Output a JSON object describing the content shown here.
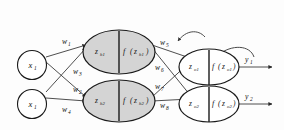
{
  "diagram": {
    "colors": {
      "background": "#fdfdfd",
      "node_fill_hidden": "#d4d4d4",
      "node_fill_output": "#ffffff",
      "node_stroke": "#1a1a1a",
      "edge": "#3a3a3a"
    },
    "input_layer": {
      "nodes": [
        {
          "id": "x1",
          "label": "x",
          "subscript": "1"
        },
        {
          "id": "x2",
          "label": "x",
          "subscript": "1"
        }
      ]
    },
    "hidden_layer": {
      "nodes": [
        {
          "id": "h1",
          "net_label": "z",
          "net_sub": "h1",
          "fn_label": "f",
          "fn_arg_open": "(",
          "fn_arg": "z",
          "fn_arg_sub": "h1",
          "fn_arg_close": ")"
        },
        {
          "id": "h2",
          "net_label": "z",
          "net_sub": "h2",
          "fn_label": "f",
          "fn_arg_open": "(",
          "fn_arg": "z",
          "fn_arg_sub": "h2",
          "fn_arg_close": ")"
        }
      ]
    },
    "output_layer": {
      "nodes": [
        {
          "id": "o1",
          "net_label": "z",
          "net_sub": "o1",
          "fn_label": "f",
          "fn_arg_open": "(",
          "fn_arg": "z",
          "fn_arg_sub": "o1",
          "fn_arg_close": ")"
        },
        {
          "id": "o2",
          "net_label": "z",
          "net_sub": "o2",
          "fn_label": "f",
          "fn_arg_open": "(",
          "fn_arg": "z",
          "fn_arg_sub": "o2",
          "fn_arg_close": ")"
        }
      ]
    },
    "outputs": [
      {
        "id": "y1",
        "label": "y",
        "subscript": "1"
      },
      {
        "id": "y2",
        "label": "y",
        "subscript": "2"
      }
    ],
    "weights_input_hidden": [
      {
        "id": "w1",
        "label": "w",
        "subscript": "1",
        "from": "x1",
        "to": "h1"
      },
      {
        "id": "w2",
        "label": "w",
        "subscript": "2",
        "from": "x1",
        "to": "h2"
      },
      {
        "id": "w3",
        "label": "w",
        "subscript": "3",
        "from": "x2",
        "to": "h1"
      },
      {
        "id": "w4",
        "label": "w",
        "subscript": "4",
        "from": "x2",
        "to": "h2"
      }
    ],
    "weights_hidden_output": [
      {
        "id": "w5",
        "label": "w",
        "subscript": "5",
        "from": "h1",
        "to": "o1"
      },
      {
        "id": "w6",
        "label": "w",
        "subscript": "6",
        "from": "h1",
        "to": "o2"
      },
      {
        "id": "w7",
        "label": "w",
        "subscript": "7",
        "from": "h2",
        "to": "o1"
      },
      {
        "id": "w8",
        "label": "w",
        "subscript": "8",
        "from": "h2",
        "to": "o2"
      }
    ]
  }
}
